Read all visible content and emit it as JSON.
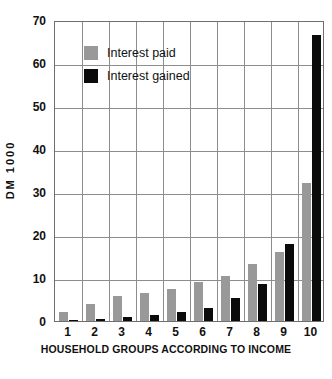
{
  "chart_data": {
    "type": "bar",
    "title": "",
    "subtitle": "",
    "xlabel": "HOUSEHOLD GROUPS ACCORDING TO INCOME",
    "ylabel": "DM 1000",
    "categories": [
      "1",
      "2",
      "3",
      "4",
      "5",
      "6",
      "7",
      "8",
      "9",
      "10"
    ],
    "series": [
      {
        "name": "Interest paid",
        "color": "#999999",
        "values": [
          2.0,
          4.0,
          5.9,
          6.4,
          7.4,
          9.0,
          10.4,
          13.3,
          16.1,
          32.2
        ]
      },
      {
        "name": "Interest gained",
        "color": "#0b0b0b",
        "values": [
          0.3,
          0.5,
          1.0,
          1.3,
          2.0,
          3.0,
          5.4,
          8.7,
          17.8,
          66.4
        ]
      }
    ],
    "ylim": [
      0,
      70
    ],
    "ytick_labels": [
      "0",
      "10",
      "20",
      "30",
      "40",
      "50",
      "60",
      "70"
    ],
    "ytick_values": [
      0,
      10,
      20,
      30,
      40,
      50,
      60,
      70
    ],
    "grid": "both",
    "legend_position": "top-left-inside"
  },
  "legend": {
    "entries": [
      {
        "label": "Interest paid",
        "swatch": "paid"
      },
      {
        "label": "Interest gained",
        "swatch": "gained"
      }
    ]
  }
}
